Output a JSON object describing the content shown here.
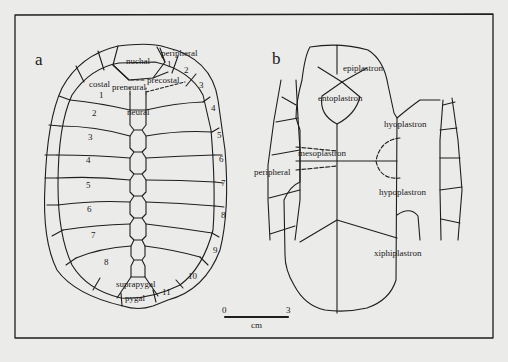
{
  "figure": {
    "panel_a": {
      "letter": "a",
      "labels": {
        "nuchal": "nuchal",
        "peripheral": "peripheral",
        "precostal": "precostal",
        "preneural": "preneural",
        "costal": "costal",
        "neural": "neural",
        "suprapygal": "suprapygal",
        "pygal": "pygal"
      },
      "costal_numbers": [
        "1",
        "2",
        "3",
        "4",
        "5",
        "6",
        "7",
        "8"
      ],
      "peripheral_numbers": [
        "1",
        "2",
        "3",
        "4",
        "5",
        "6",
        "7",
        "8",
        "9",
        "10",
        "11"
      ]
    },
    "panel_b": {
      "letter": "b",
      "labels": {
        "epiplastron": "epiplastron",
        "entoplastron": "entoplastron",
        "hyoplastron": "hyoplastron",
        "mesoplastron": "mesoplastron",
        "peripheral": "peripheral",
        "hypoplastron": "hypoplastron",
        "xiphiplastron": "xiphiplastron"
      }
    },
    "scale_bar": {
      "min": "0",
      "max": "3",
      "unit": "cm"
    }
  }
}
